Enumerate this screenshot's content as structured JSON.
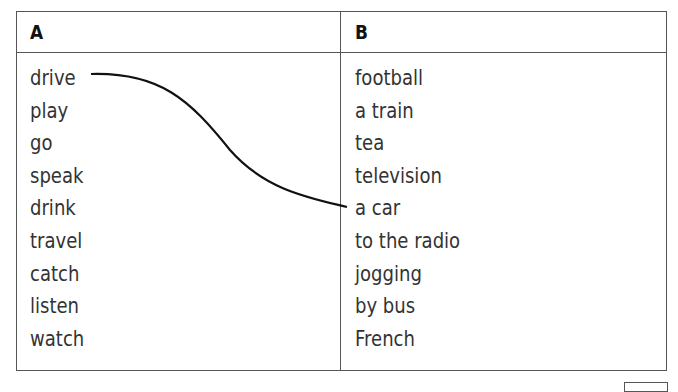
{
  "table": {
    "column_a": {
      "header": "A",
      "items": [
        "drive",
        "play",
        "go",
        "speak",
        "drink",
        "travel",
        "catch",
        "listen",
        "watch"
      ]
    },
    "column_b": {
      "header": "B",
      "items": [
        "football",
        "a train",
        "tea",
        "television",
        "a car",
        "to the radio",
        "jogging",
        "by bus",
        "French"
      ]
    },
    "example_match": {
      "from": "drive",
      "to": "a car"
    }
  },
  "colors": {
    "border": "#555555",
    "text": "#333333",
    "line": "#111111"
  }
}
